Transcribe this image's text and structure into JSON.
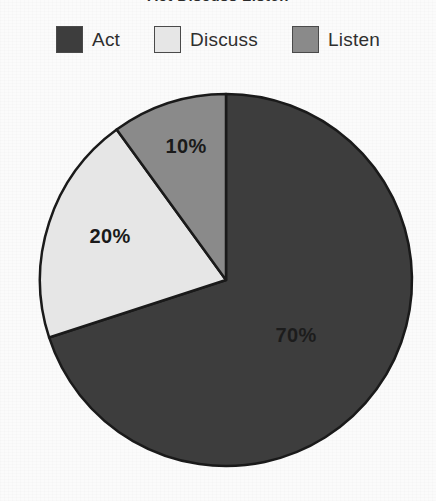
{
  "chart_data": {
    "type": "pie",
    "title": "Act Discuss Listen",
    "categories": [
      "Act",
      "Discuss",
      "Listen"
    ],
    "values": [
      70,
      20,
      10
    ],
    "value_labels": [
      "70%",
      "20%",
      "10%"
    ],
    "units": "percent",
    "total": 100,
    "start_angle_deg": 0,
    "direction": "clockwise",
    "legend_position": "top",
    "grid": false,
    "xlabel": "",
    "ylabel": "",
    "colors": {
      "act": "#3d3d3d",
      "discuss": "#e6e6e6",
      "listen": "#8a8a8a",
      "outline": "#1a1a1a",
      "background": "#fbfbfb",
      "label_text": "#1a1a1a"
    },
    "slices": [
      {
        "name": "Act",
        "value": 70,
        "label": "70%",
        "color": "#3d3d3d",
        "label_color": "#1c1c1c",
        "start_deg": 0,
        "end_deg": 252,
        "label_x": 296,
        "label_y": 337
      },
      {
        "name": "Discuss",
        "value": 20,
        "label": "20%",
        "color": "#e6e6e6",
        "label_color": "#1a1a1a",
        "start_deg": 252,
        "end_deg": 324,
        "label_x": 110,
        "label_y": 238
      },
      {
        "name": "Listen",
        "value": 10,
        "label": "10%",
        "color": "#8a8a8a",
        "label_color": "#1a1a1a",
        "start_deg": 324,
        "end_deg": 360,
        "label_x": 186,
        "label_y": 148
      }
    ],
    "geometry": {
      "center_x": 226,
      "center_y": 280,
      "radius": 186
    }
  },
  "legend": {
    "items": [
      {
        "label": "Act",
        "color": "#3d3d3d"
      },
      {
        "label": "Discuss",
        "color": "#e6e6e6"
      },
      {
        "label": "Listen",
        "color": "#8a8a8a"
      }
    ]
  }
}
